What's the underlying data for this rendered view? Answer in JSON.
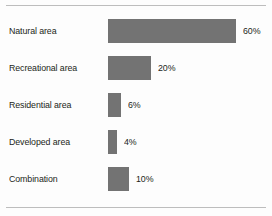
{
  "chart_data": {
    "type": "bar",
    "orientation": "horizontal",
    "title": "",
    "xlabel": "",
    "ylabel": "",
    "categories": [
      "Natural area",
      "Recreational area",
      "Residential area",
      "Developed area",
      "Combination"
    ],
    "values": [
      60,
      20,
      6,
      4,
      10
    ],
    "value_labels": [
      "60%",
      "20%",
      "6%",
      "4%",
      "10%"
    ],
    "xlim": [
      0,
      60
    ],
    "grid": false,
    "legend": null,
    "bar_color": "#737373",
    "rule_color": "#bdbdbd",
    "background": "#fdfdfd",
    "text_color": "#231f20"
  },
  "rows": [
    {
      "label": "Natural area",
      "value": 60,
      "value_label": "60%"
    },
    {
      "label": "Recreational area",
      "value": 20,
      "value_label": "20%"
    },
    {
      "label": "Residential area",
      "value": 6,
      "value_label": "6%"
    },
    {
      "label": "Developed area",
      "value": 4,
      "value_label": "4%"
    },
    {
      "label": "Combination",
      "value": 10,
      "value_label": "10%"
    }
  ]
}
